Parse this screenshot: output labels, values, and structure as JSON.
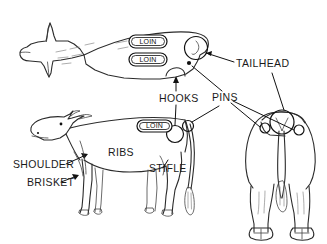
{
  "figure": {
    "background_color": "#ffffff",
    "line_color": "#2b2b2b",
    "text_color": "#1a1a1a",
    "width": 327,
    "height": 244
  },
  "views": [
    {
      "id": "top-view",
      "name": "Top / overhead view of cow"
    },
    {
      "id": "side-view",
      "name": "Side profile view of cow"
    },
    {
      "id": "rear-view",
      "name": "Rear view of cow"
    }
  ],
  "callout_pills": [
    {
      "id": "loin-top-1",
      "text": "LOIN"
    },
    {
      "id": "loin-top-2",
      "text": "LOIN"
    },
    {
      "id": "loin-side-1",
      "text": "LOIN"
    }
  ],
  "labels": [
    {
      "id": "tailhead",
      "text": "TAILHEAD"
    },
    {
      "id": "hooks",
      "text": "HOOKS"
    },
    {
      "id": "pins",
      "text": "PINS"
    },
    {
      "id": "shoulder",
      "text": "SHOULDER"
    },
    {
      "id": "brisket",
      "text": "BRISKET"
    },
    {
      "id": "ribs",
      "text": "RIBS"
    },
    {
      "id": "stifle",
      "text": "STIFLE"
    }
  ]
}
